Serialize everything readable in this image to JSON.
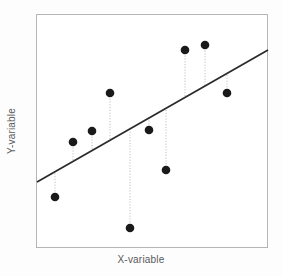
{
  "chart_data": {
    "type": "scatter",
    "title": "",
    "subtitle": "",
    "xlabel": "X-variable",
    "ylabel": "Y-variable",
    "xlim": [
      0,
      100
    ],
    "ylim": [
      0,
      100
    ],
    "grid": false,
    "legend": "none",
    "annotations": [
      "Dotted vertical stems show the residual from each point to the fitted line"
    ],
    "points": [
      {
        "id": "p1",
        "x": 8.2,
        "y": 21.8,
        "px": 55,
        "py": 197
      },
      {
        "id": "p2",
        "x": 16.0,
        "y": 45.3,
        "px": 73,
        "py": 142
      },
      {
        "id": "p3",
        "x": 24.1,
        "y": 50.0,
        "px": 92,
        "py": 131
      },
      {
        "id": "p4",
        "x": 31.9,
        "y": 66.2,
        "px": 110,
        "py": 93
      },
      {
        "id": "p5",
        "x": 40.5,
        "y": 8.5,
        "px": 130,
        "py": 228
      },
      {
        "id": "p6",
        "x": 48.7,
        "y": 50.4,
        "px": 149,
        "py": 130
      },
      {
        "id": "p7",
        "x": 56.0,
        "y": 33.3,
        "px": 166,
        "py": 170
      },
      {
        "id": "p8",
        "x": 64.2,
        "y": 84.6,
        "px": 185,
        "py": 50
      },
      {
        "id": "p9",
        "x": 72.8,
        "y": 86.8,
        "px": 205,
        "py": 45
      },
      {
        "id": "p10",
        "x": 82.3,
        "y": 66.2,
        "px": 227,
        "py": 93
      }
    ],
    "series": [
      {
        "name": "observations",
        "values": [
          21.8,
          45.3,
          50.0,
          66.2,
          8.5,
          50.4,
          33.3,
          84.6,
          86.8,
          66.2
        ]
      }
    ],
    "x": [
      8.2,
      16.0,
      24.1,
      31.9,
      40.5,
      48.7,
      56.0,
      64.2,
      72.8,
      82.3
    ],
    "fit_line": {
      "name": "regression-line",
      "x_start": 0.4,
      "y_start": 28.2,
      "x_end": 100.0,
      "y_end": 84.6,
      "px_start": 37,
      "py_start": 182,
      "px_end": 268,
      "py_end": 50
    },
    "residual_stems": [
      {
        "id": "r1",
        "px": 55,
        "py_point": 197,
        "py_line": 172
      },
      {
        "id": "r2",
        "px": 73,
        "py_point": 142,
        "py_line": 161
      },
      {
        "id": "r3",
        "px": 92,
        "py_point": 131,
        "py_line": 150
      },
      {
        "id": "r4",
        "px": 110,
        "py_point": 93,
        "py_line": 140
      },
      {
        "id": "r5",
        "px": 130,
        "py_point": 228,
        "py_line": 129
      },
      {
        "id": "r6",
        "px": 149,
        "py_point": 130,
        "py_line": 118
      },
      {
        "id": "r7",
        "px": 166,
        "py_point": 170,
        "py_line": 109
      },
      {
        "id": "r8",
        "px": 185,
        "py_point": 50,
        "py_line": 98
      },
      {
        "id": "r9",
        "px": 205,
        "py_point": 45,
        "py_line": 87
      },
      {
        "id": "r10",
        "px": 227,
        "py_point": 93,
        "py_line": 74
      }
    ]
  },
  "style": {
    "point_color": "#1a1a1a",
    "line_color": "#2b2b2b",
    "stem_color": "#b9b9b9",
    "frame_color": "#b5b5b5",
    "label_color": "#59595b",
    "plot_background": "#ffffff",
    "figure_background": "#fdfdfd",
    "point_radius": 4.3,
    "line_width": 1.8,
    "stem_width": 0.9
  },
  "frame": {
    "left": 36,
    "top": 14,
    "right": 268,
    "bottom": 248
  }
}
